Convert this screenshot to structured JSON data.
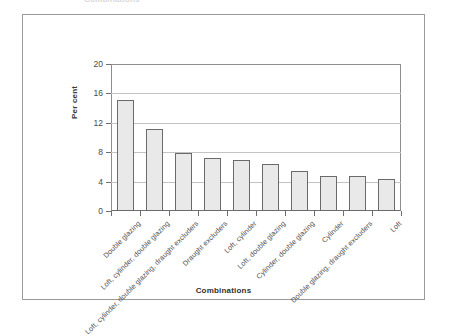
{
  "figure": {
    "top_caption": "Combinations"
  },
  "chart_data": {
    "type": "bar",
    "title": "",
    "xlabel": "Combinations",
    "ylabel": "Per cent",
    "ylim": [
      0,
      20
    ],
    "yticks": [
      0,
      4,
      8,
      12,
      16,
      20
    ],
    "ytick_labels": [
      "0",
      "4",
      "8",
      "12",
      "16",
      "20"
    ],
    "grid": true,
    "legend": "none",
    "categories": [
      "Double glazing",
      "Loft, cylinder, double glazing",
      "Loft, cylinder, double glazing, draught excluders",
      "Draught excluders",
      "Loft, cylinder",
      "Loft, double glazing",
      "Cylinder, double glazing",
      "Cylinder",
      "Double glazing, draught excluders",
      "Loft"
    ],
    "values": [
      15.1,
      11.1,
      7.9,
      7.2,
      6.9,
      6.4,
      5.5,
      4.8,
      4.8,
      4.3
    ],
    "bar_fill": "#e9e9e9",
    "bar_edge": "#6a6a6a"
  }
}
